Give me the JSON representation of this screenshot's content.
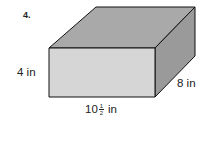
{
  "problem": {
    "number": "4."
  },
  "figure": {
    "shape": "rectangular prism",
    "colors": {
      "front_face": "#d6d6d6",
      "top_face": "#a9a9a9",
      "side_face": "#9a9a9a",
      "edges": "#111111"
    },
    "labels": {
      "height": "4 in",
      "depth": "8 in",
      "width_whole": "10",
      "width_numerator": "1",
      "width_denominator": "2",
      "width_unit": "in"
    }
  }
}
